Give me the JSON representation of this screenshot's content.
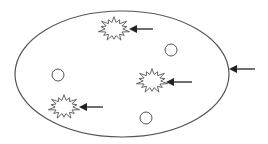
{
  "diagram": {
    "stroke_color": "#555555",
    "arrow_color": "#222222",
    "background": "#ffffff",
    "ellipse": {
      "cx": 122,
      "cy": 74,
      "rx": 107,
      "ry": 63
    },
    "circles": [
      {
        "cx": 171,
        "cy": 50,
        "r": 6
      },
      {
        "cx": 58,
        "cy": 75,
        "r": 6
      },
      {
        "cx": 146,
        "cy": 118,
        "r": 6
      }
    ],
    "starbursts": [
      {
        "cx": 114,
        "cy": 29,
        "r_outer": 13,
        "r_inner": 8,
        "points": 14
      },
      {
        "cx": 152,
        "cy": 81,
        "r_outer": 13,
        "r_inner": 8,
        "points": 14
      },
      {
        "cx": 64,
        "cy": 107,
        "r_outer": 13,
        "r_inner": 8,
        "points": 14
      }
    ],
    "arrows": [
      {
        "target": "starburst-1",
        "x1": 153,
        "y1": 29,
        "x2": 129,
        "y2": 29
      },
      {
        "target": "starburst-2",
        "x1": 192,
        "y1": 82,
        "x2": 166,
        "y2": 82
      },
      {
        "target": "starburst-3",
        "x1": 103,
        "y1": 107,
        "x2": 79,
        "y2": 107
      },
      {
        "target": "ellipse-boundary",
        "x1": 255,
        "y1": 69,
        "x2": 229,
        "y2": 69
      }
    ]
  }
}
